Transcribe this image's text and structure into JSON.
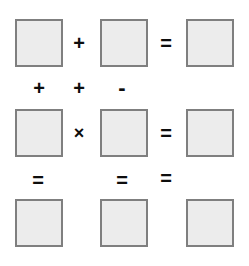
{
  "puzzle": {
    "title": "Math Puzzle Grid",
    "grid_size": "3x3",
    "colors": {
      "box_fill": "#ececec",
      "box_border": "#7f7f7f",
      "operator_text": "#0d0d0d",
      "background": "#ffffff"
    },
    "boxes": [
      {
        "id": "box-r1c1",
        "value": "",
        "row": 1,
        "col": 1,
        "x": 15,
        "y": 19
      },
      {
        "id": "box-r1c2",
        "value": "",
        "row": 1,
        "col": 2,
        "x": 100,
        "y": 19
      },
      {
        "id": "box-r1c3",
        "value": "",
        "row": 1,
        "col": 3,
        "x": 186,
        "y": 19
      },
      {
        "id": "box-r2c1",
        "value": "",
        "row": 2,
        "col": 1,
        "x": 15,
        "y": 109
      },
      {
        "id": "box-r2c2",
        "value": "",
        "row": 2,
        "col": 2,
        "x": 100,
        "y": 109
      },
      {
        "id": "box-r2c3",
        "value": "",
        "row": 2,
        "col": 3,
        "x": 186,
        "y": 109
      },
      {
        "id": "box-r3c1",
        "value": "",
        "row": 3,
        "col": 1,
        "x": 15,
        "y": 199
      },
      {
        "id": "box-r3c2",
        "value": "",
        "row": 3,
        "col": 2,
        "x": 100,
        "y": 199
      },
      {
        "id": "box-r3c3",
        "value": "",
        "row": 3,
        "col": 3,
        "x": 186,
        "y": 199
      }
    ],
    "operators": [
      {
        "id": "op-r1-plus",
        "symbol": "+",
        "kind": "plus",
        "x": 65,
        "y": 29
      },
      {
        "id": "op-r1-equals",
        "symbol": "=",
        "kind": "equals",
        "x": 152,
        "y": 29
      },
      {
        "id": "op-c1-plus",
        "symbol": "+",
        "kind": "plus",
        "x": 25,
        "y": 74
      },
      {
        "id": "op-c2-plus",
        "symbol": "+",
        "kind": "plus",
        "x": 65,
        "y": 74
      },
      {
        "id": "op-c3-minus",
        "symbol": "-",
        "kind": "minus",
        "x": 108,
        "y": 74
      },
      {
        "id": "op-r2-times",
        "symbol": "×",
        "kind": "times",
        "x": 65,
        "y": 119
      },
      {
        "id": "op-r2-equals",
        "symbol": "=",
        "kind": "equals",
        "x": 152,
        "y": 119
      },
      {
        "id": "op-c1-equals",
        "symbol": "=",
        "kind": "equals",
        "x": 24,
        "y": 166
      },
      {
        "id": "op-c2-equals",
        "symbol": "=",
        "kind": "equals",
        "x": 108,
        "y": 166
      },
      {
        "id": "op-c3-equals",
        "symbol": "=",
        "kind": "equals",
        "x": 152,
        "y": 164
      }
    ]
  }
}
